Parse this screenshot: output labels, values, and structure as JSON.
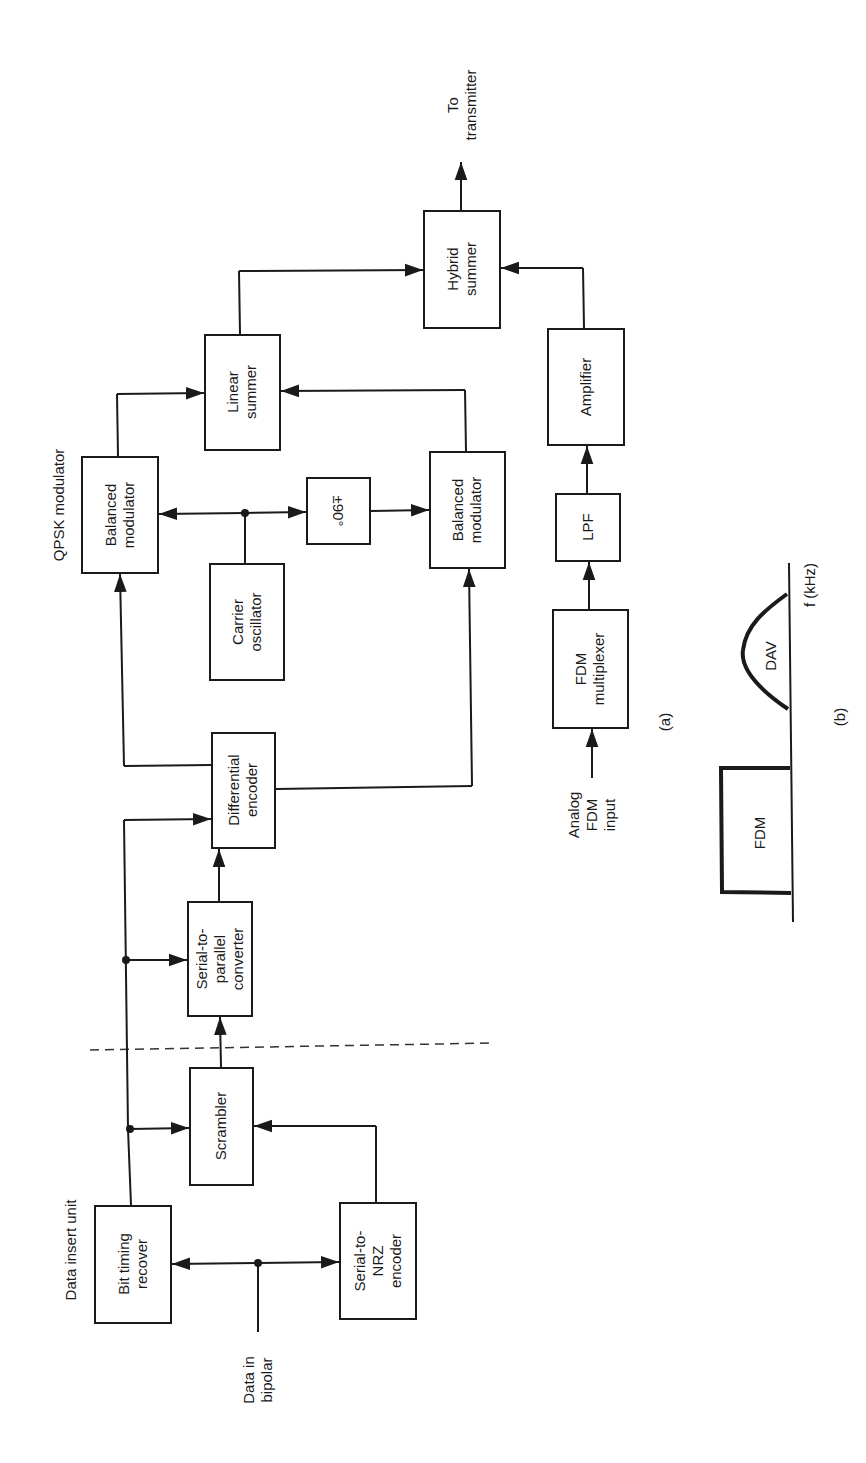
{
  "figure": {
    "orientation": "rotated 90 degrees counter-clockwise",
    "part_a_caption": "(a)",
    "part_b_caption": "(b)"
  },
  "sections": {
    "data_insert_unit": "Data insert unit",
    "qpsk_modulator": "QPSK modulator"
  },
  "blocks": {
    "bit_timing": [
      "Bit timing",
      "recover"
    ],
    "serial_nrz": [
      "Serial-to-",
      "NRZ",
      "encoder"
    ],
    "scrambler": [
      "Scrambler"
    ],
    "serial_parallel": [
      "Serial-to-",
      "parallel",
      "converter"
    ],
    "diff_encoder": [
      "Differential",
      "encoder"
    ],
    "bal_mod_1": [
      "Balanced",
      "modulator"
    ],
    "carrier_osc": [
      "Carrier",
      "oscillator"
    ],
    "phase_shift": [
      "±90°"
    ],
    "bal_mod_2": [
      "Balanced",
      "modulator"
    ],
    "linear_summer": [
      "Linear",
      "summer"
    ],
    "hybrid_summer": [
      "Hybrid",
      "summer"
    ],
    "amplifier": [
      "Amplifier"
    ],
    "lpf": [
      "LPF"
    ],
    "fdm_mux": [
      "FDM",
      "multiplexer"
    ]
  },
  "io_labels": {
    "data_in": [
      "Data in",
      "bipolar"
    ],
    "analog_in": [
      "Analog",
      "FDM",
      "input"
    ],
    "to_tx": [
      "To",
      "transmitter"
    ]
  },
  "spectrum": {
    "fdm_label": "FDM",
    "dav_label": "DAV",
    "axis_label": "f (kHz)"
  }
}
